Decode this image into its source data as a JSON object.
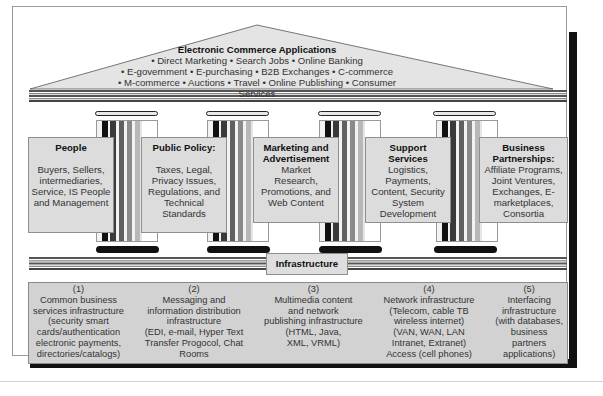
{
  "roof": {
    "title": "Electronic Commerce Applications",
    "lines": [
      "• Direct Marketing • Search Jobs • Online Banking",
      "• E-government • E-purchasing • B2B Exchanges • C-commerce",
      "• M-commerce • Auctions • Travel • Online Publishing • Consumer Services"
    ]
  },
  "pillars": [
    {
      "title": [
        "People"
      ],
      "body": [
        "Buyers, Sellers,",
        "intermediaries,",
        "Service, IS People",
        "and Management"
      ]
    },
    {
      "title": [
        "Public Policy:"
      ],
      "body": [
        "Taxes, Legal,",
        "Privacy Issues,",
        "Regulations, and",
        "Technical",
        "Standards"
      ]
    },
    {
      "title": [
        "Marketing and",
        "Advertisement"
      ],
      "body": [
        "Market",
        "Research,",
        "Promotions, and",
        "Web Content"
      ]
    },
    {
      "title": [
        "Support",
        "Services"
      ],
      "body": [
        "Logistics,",
        "Payments,",
        "Content, Security",
        "System",
        "Development"
      ]
    },
    {
      "title": [
        "Business",
        "Partnerships:"
      ],
      "body": [
        "Affiliate Programs,",
        "Joint Ventures,",
        "Exchanges, E-",
        "marketplaces,",
        "Consortia"
      ]
    }
  ],
  "infrastructure": {
    "label": "Infrastructure",
    "columns": [
      [
        "(1)",
        "Common business",
        "services infrastructure",
        "(security smart",
        "cards/authentication",
        "electronic payments,",
        "directories/catalogs)"
      ],
      [
        "(2)",
        "Messaging and",
        "information distribution",
        "infrastructure",
        "(EDI, e-mail, Hyper Text",
        "Transfer Progocol, Chat",
        "Rooms"
      ],
      [
        "(3)",
        "Multimedia content",
        "and network",
        "publishing infrastructure",
        "(HTML, Java,",
        "XML, VRML)"
      ],
      [
        "(4)",
        "Network infrastructure",
        "(Telecom, cable TB",
        "wireless internet)",
        "(VAN, WAN, LAN",
        "Intranet, Extranet)",
        "Access (cell phones)"
      ],
      [
        "(5)",
        "Interfacing",
        "infrastructure",
        "(with databases,",
        "business",
        "partners",
        "applications)"
      ]
    ]
  },
  "colors": {
    "card_fill": "#dcdcdc",
    "infra_fill": "#d2d2d2",
    "roof_fill": "#e4e4e4",
    "shadow": "#111111"
  }
}
